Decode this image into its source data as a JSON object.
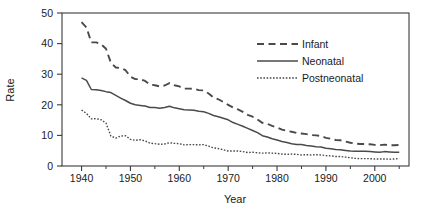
{
  "chart_data": {
    "type": "line",
    "title": "",
    "xlabel": "Year",
    "ylabel": "Rate",
    "xlim": [
      1936,
      2007
    ],
    "ylim": [
      0,
      50
    ],
    "xticks": [
      1940,
      1950,
      1960,
      1970,
      1980,
      1990,
      2000
    ],
    "xtick_labels": [
      "1940",
      "1950",
      "1960",
      "1970",
      "1980",
      "1990",
      "2000"
    ],
    "xticks_minor": [
      1945,
      1955,
      1965,
      1975,
      1985,
      1995,
      2005
    ],
    "yticks": [
      0,
      10,
      20,
      30,
      40,
      50
    ],
    "ytick_labels": [
      "0",
      "10",
      "20",
      "30",
      "40",
      "50"
    ],
    "grid": false,
    "legend_position": "upper right",
    "x": [
      1940,
      1941,
      1942,
      1943,
      1944,
      1945,
      1946,
      1947,
      1948,
      1949,
      1950,
      1951,
      1952,
      1953,
      1954,
      1955,
      1956,
      1957,
      1958,
      1959,
      1960,
      1961,
      1962,
      1963,
      1964,
      1965,
      1966,
      1967,
      1968,
      1969,
      1970,
      1971,
      1972,
      1973,
      1974,
      1975,
      1976,
      1977,
      1978,
      1979,
      1980,
      1981,
      1982,
      1983,
      1984,
      1985,
      1986,
      1987,
      1988,
      1989,
      1990,
      1991,
      1992,
      1993,
      1994,
      1995,
      1996,
      1997,
      1998,
      1999,
      2000,
      2001,
      2002,
      2003,
      2004,
      2005
    ],
    "series": [
      {
        "name": "Infant",
        "style": "dashed",
        "values": [
          47.0,
          45.3,
          40.4,
          40.4,
          39.8,
          38.3,
          33.8,
          32.2,
          32.0,
          31.3,
          29.2,
          28.4,
          28.4,
          27.8,
          26.6,
          26.4,
          26.0,
          26.3,
          27.1,
          26.4,
          26.0,
          25.3,
          25.3,
          25.2,
          24.8,
          24.7,
          23.7,
          22.4,
          21.8,
          20.9,
          20.0,
          19.1,
          18.5,
          17.7,
          16.7,
          16.1,
          15.2,
          14.1,
          13.8,
          13.1,
          12.6,
          11.9,
          11.5,
          11.2,
          10.8,
          10.6,
          10.4,
          10.1,
          10.0,
          9.8,
          9.2,
          8.9,
          8.5,
          8.4,
          8.0,
          7.6,
          7.3,
          7.2,
          7.2,
          7.1,
          6.9,
          6.8,
          7.0,
          6.8,
          6.8,
          6.9
        ]
      },
      {
        "name": "Neonatal",
        "style": "solid",
        "values": [
          28.8,
          28.0,
          25.0,
          24.9,
          24.7,
          24.3,
          24.0,
          23.1,
          22.2,
          21.4,
          20.5,
          20.0,
          19.8,
          19.6,
          19.1,
          19.1,
          18.9,
          19.1,
          19.5,
          19.0,
          18.7,
          18.4,
          18.3,
          18.2,
          17.9,
          17.7,
          17.2,
          16.5,
          16.1,
          15.6,
          15.1,
          14.2,
          13.6,
          13.0,
          12.3,
          11.6,
          10.9,
          9.9,
          9.5,
          8.9,
          8.5,
          8.0,
          7.7,
          7.3,
          7.0,
          7.0,
          6.7,
          6.5,
          6.3,
          6.2,
          5.8,
          5.6,
          5.4,
          5.3,
          5.1,
          4.9,
          4.8,
          4.8,
          4.8,
          4.7,
          4.6,
          4.5,
          4.7,
          4.6,
          4.5,
          4.5
        ]
      },
      {
        "name": "Postneonatal",
        "style": "dotted",
        "values": [
          18.3,
          17.2,
          15.4,
          15.5,
          15.1,
          14.0,
          9.8,
          9.1,
          9.8,
          9.9,
          8.7,
          8.4,
          8.6,
          8.2,
          7.5,
          7.3,
          7.1,
          7.2,
          7.6,
          7.4,
          7.3,
          6.9,
          7.0,
          7.0,
          6.9,
          7.0,
          6.5,
          5.9,
          5.7,
          5.3,
          4.9,
          4.9,
          4.9,
          4.7,
          4.4,
          4.5,
          4.3,
          4.2,
          4.3,
          4.2,
          4.1,
          3.9,
          3.8,
          3.9,
          3.8,
          3.6,
          3.7,
          3.6,
          3.7,
          3.6,
          3.4,
          3.3,
          3.1,
          3.1,
          2.9,
          2.7,
          2.5,
          2.4,
          2.4,
          2.4,
          2.3,
          2.3,
          2.3,
          2.2,
          2.3,
          2.4
        ]
      }
    ]
  },
  "legend": {
    "items": [
      {
        "label": "Infant"
      },
      {
        "label": "Neonatal"
      },
      {
        "label": "Postneonatal"
      }
    ]
  },
  "axes": {
    "x_title": "Year",
    "y_title": "Rate"
  }
}
